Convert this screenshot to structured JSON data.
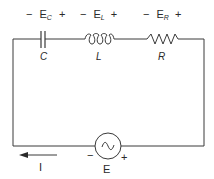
{
  "diagram": {
    "type": "series RLC circuit",
    "components": [
      {
        "id": "capacitor",
        "label": "C",
        "voltage": {
          "neg": "−",
          "symbol": "E",
          "subscript": "C",
          "pos": "+"
        }
      },
      {
        "id": "inductor",
        "label": "L",
        "voltage": {
          "neg": "−",
          "symbol": "E",
          "subscript": "L",
          "pos": "+"
        }
      },
      {
        "id": "resistor",
        "label": "R",
        "voltage": {
          "neg": "−",
          "symbol": "E",
          "subscript": "R",
          "pos": "+"
        }
      }
    ],
    "source": {
      "label": "E",
      "symbol": "~",
      "neg": "−",
      "pos": "+"
    },
    "current": {
      "label": "I",
      "direction": "left"
    },
    "colors": {
      "line": "#3a3a3a",
      "background": "#ffffff"
    }
  }
}
